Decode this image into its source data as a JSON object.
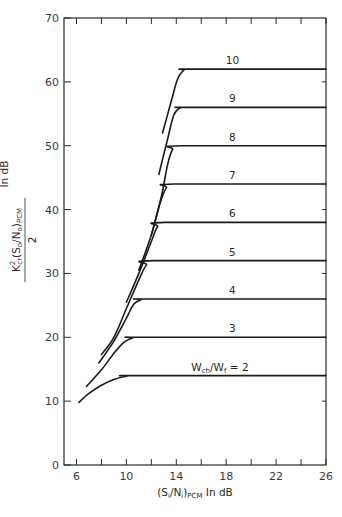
{
  "chart_data": {
    "type": "line",
    "title": "",
    "xlabel": {
      "main": "(S",
      "sub1": "i",
      "mid": "/N",
      "sub2": "i",
      "close": ")",
      "sub3": "PCM",
      "tail": " In dB"
    },
    "ylabel": {
      "numerator_k": "K",
      "k_sup": "2",
      "k_sub": "cr",
      "open": "(S",
      "sub1": "o",
      "mid": "/N",
      "sub2": "o",
      "close": ")",
      "sub3": "PCM",
      "denominator": "2",
      "tail": "In dB"
    },
    "xlim": [
      5,
      26
    ],
    "ylim": [
      0,
      70
    ],
    "xticks": [
      6,
      8,
      10,
      12,
      14,
      16,
      18,
      20,
      22,
      24,
      26
    ],
    "xtick_labels": [
      "6",
      "10",
      "14",
      "18",
      "22",
      "26"
    ],
    "xtick_label_values": [
      6,
      10,
      14,
      18,
      22,
      26
    ],
    "yticks": [
      0,
      10,
      20,
      30,
      40,
      50,
      60,
      70
    ],
    "ytick_labels": [
      "0",
      "10",
      "20",
      "30",
      "40",
      "50",
      "60",
      "70"
    ],
    "grid": false,
    "series": [
      {
        "name": "Wch/Wf = 2",
        "label": "W",
        "label_sub": "ch",
        "label_mid": "/W",
        "label_sub2": "f",
        "label_tail": " = 2",
        "points": [
          [
            6.2,
            9.8
          ],
          [
            7,
            11.2
          ],
          [
            8,
            12.5
          ],
          [
            9,
            13.4
          ],
          [
            10,
            13.9
          ],
          [
            10.8,
            14
          ],
          [
            26,
            14
          ]
        ]
      },
      {
        "name": "3",
        "label": "3",
        "points": [
          [
            6.8,
            12.3
          ],
          [
            8,
            14.9
          ],
          [
            9,
            17.5
          ],
          [
            9.8,
            19.2
          ],
          [
            10.5,
            19.9
          ],
          [
            11.2,
            20
          ],
          [
            26,
            20
          ]
        ]
      },
      {
        "name": "4",
        "label": "4",
        "points": [
          [
            7.8,
            16
          ],
          [
            9,
            19.4
          ],
          [
            10,
            23
          ],
          [
            10.6,
            25.2
          ],
          [
            11.2,
            25.9
          ],
          [
            11.8,
            26
          ],
          [
            26,
            26
          ]
        ]
      },
      {
        "name": "5",
        "label": "5",
        "points": [
          [
            8.0,
            17.3
          ],
          [
            9,
            20
          ],
          [
            10,
            24.5
          ],
          [
            11,
            29
          ],
          [
            11.6,
            31.3
          ],
          [
            12.2,
            32
          ],
          [
            26,
            32
          ]
        ]
      },
      {
        "name": "6",
        "label": "6",
        "points": [
          [
            10,
            25.5
          ],
          [
            11,
            30
          ],
          [
            12,
            35
          ],
          [
            12.5,
            37.3
          ],
          [
            13.1,
            38
          ],
          [
            26,
            38
          ]
        ]
      },
      {
        "name": "7",
        "label": "7",
        "points": [
          [
            11,
            30.5
          ],
          [
            12,
            36
          ],
          [
            12.7,
            41
          ],
          [
            13.2,
            43.4
          ],
          [
            13.8,
            44
          ],
          [
            26,
            44
          ]
        ]
      },
      {
        "name": "8",
        "label": "8",
        "points": [
          [
            12,
            36
          ],
          [
            12.8,
            42
          ],
          [
            13.3,
            47
          ],
          [
            13.7,
            49.4
          ],
          [
            14.3,
            50
          ],
          [
            26,
            50
          ]
        ]
      },
      {
        "name": "9",
        "label": "9",
        "points": [
          [
            12.6,
            45.5
          ],
          [
            13.3,
            51
          ],
          [
            13.8,
            54.8
          ],
          [
            14.3,
            55.9
          ],
          [
            14.9,
            56
          ],
          [
            26,
            56
          ]
        ]
      },
      {
        "name": "10",
        "label": "10",
        "points": [
          [
            12.9,
            52
          ],
          [
            13.6,
            57
          ],
          [
            14.1,
            60.4
          ],
          [
            14.6,
            61.8
          ],
          [
            15.2,
            62
          ],
          [
            26,
            62
          ]
        ]
      }
    ],
    "series_label_x": [
      17.5,
      18.5,
      18.5,
      18.5,
      18.5,
      18.5,
      18.5,
      18.5,
      18.5
    ]
  }
}
